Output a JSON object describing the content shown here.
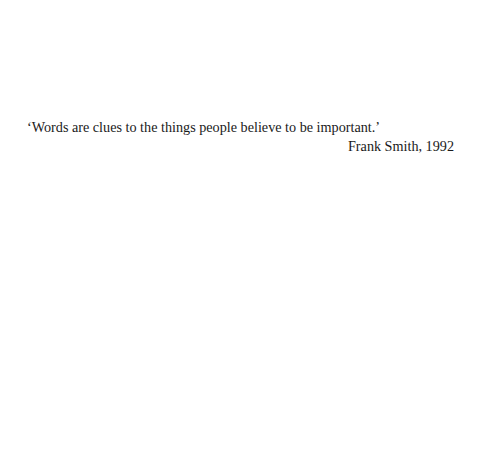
{
  "epigraph": {
    "quote": "‘Words are clues to the things people believe to be important.’",
    "attribution": "Frank Smith, 1992"
  }
}
